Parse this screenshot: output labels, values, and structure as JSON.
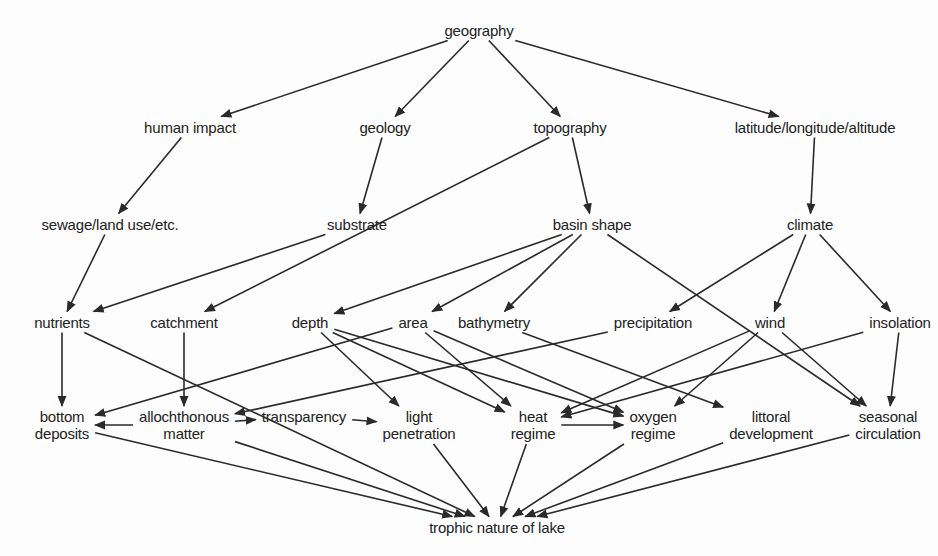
{
  "diagram": {
    "type": "directed-graph",
    "line_color": "#2a2a2a",
    "text_color": "#222222",
    "background": "#fdfdfd",
    "nodes": {
      "geography": {
        "label": "geography",
        "x": 479,
        "y": 30
      },
      "human_impact": {
        "label": "human impact",
        "x": 190,
        "y": 127
      },
      "geology": {
        "label": "geology",
        "x": 385,
        "y": 127
      },
      "topography": {
        "label": "topography",
        "x": 570,
        "y": 127
      },
      "lat_long_alt": {
        "label": "latitude/longitude/altitude",
        "x": 815,
        "y": 127
      },
      "sewage": {
        "label": "sewage/land use/etc.",
        "x": 110,
        "y": 224
      },
      "substrate": {
        "label": "substrate",
        "x": 357,
        "y": 224
      },
      "basin_shape": {
        "label": "basin shape",
        "x": 592,
        "y": 224
      },
      "climate": {
        "label": "climate",
        "x": 810,
        "y": 224
      },
      "nutrients": {
        "label": "nutrients",
        "x": 62,
        "y": 322
      },
      "catchment": {
        "label": "catchment",
        "x": 184,
        "y": 322
      },
      "depth": {
        "label": "depth",
        "x": 310,
        "y": 322
      },
      "area": {
        "label": "area",
        "x": 413,
        "y": 322
      },
      "bathymetry": {
        "label": "bathymetry",
        "x": 494,
        "y": 322
      },
      "precipitation": {
        "label": "precipitation",
        "x": 653,
        "y": 322
      },
      "wind": {
        "label": "wind",
        "x": 770,
        "y": 322
      },
      "insolation": {
        "label": "insolation",
        "x": 900,
        "y": 322
      },
      "bottom_deposits": {
        "label": "bottom\ndeposits",
        "x": 62,
        "y": 425
      },
      "allochthonous_matter": {
        "label": "allochthonous\nmatter",
        "x": 184,
        "y": 425
      },
      "transparency": {
        "label": "transparency",
        "x": 304,
        "y": 416
      },
      "light_penetration": {
        "label": "light\npenetration",
        "x": 419,
        "y": 425
      },
      "heat_regime": {
        "label": "heat\nregime",
        "x": 533,
        "y": 425
      },
      "oxygen_regime": {
        "label": "oxygen\nregime",
        "x": 653,
        "y": 425
      },
      "littoral_development": {
        "label": "littoral\ndevelopment",
        "x": 771,
        "y": 425
      },
      "seasonal_circulation": {
        "label": "seasonal\ncirculation",
        "x": 888,
        "y": 425
      },
      "trophic_nature": {
        "label": "trophic nature of lake",
        "x": 497,
        "y": 527
      }
    },
    "edges": [
      {
        "from": "geography",
        "to": "human_impact"
      },
      {
        "from": "geography",
        "to": "geology"
      },
      {
        "from": "geography",
        "to": "topography"
      },
      {
        "from": "geography",
        "to": "lat_long_alt"
      },
      {
        "from": "human_impact",
        "to": "sewage"
      },
      {
        "from": "geology",
        "to": "substrate"
      },
      {
        "from": "topography",
        "to": "catchment"
      },
      {
        "from": "topography",
        "to": "basin_shape"
      },
      {
        "from": "lat_long_alt",
        "to": "climate"
      },
      {
        "from": "sewage",
        "to": "nutrients"
      },
      {
        "from": "substrate",
        "to": "nutrients"
      },
      {
        "from": "basin_shape",
        "to": "depth"
      },
      {
        "from": "basin_shape",
        "to": "area"
      },
      {
        "from": "basin_shape",
        "to": "bathymetry"
      },
      {
        "from": "basin_shape",
        "to": "seasonal_circulation"
      },
      {
        "from": "climate",
        "to": "precipitation"
      },
      {
        "from": "climate",
        "to": "wind"
      },
      {
        "from": "climate",
        "to": "insolation"
      },
      {
        "from": "nutrients",
        "to": "trophic_nature"
      },
      {
        "from": "nutrients",
        "to": "bottom_deposits",
        "note": "line from nutrients region down to bottom deposits"
      },
      {
        "from": "catchment",
        "to": "allochthonous_matter"
      },
      {
        "from": "area",
        "to": "bottom_deposits"
      },
      {
        "from": "precipitation",
        "to": "allochthonous_matter"
      },
      {
        "from": "depth",
        "to": "light_penetration"
      },
      {
        "from": "depth",
        "to": "heat_regime"
      },
      {
        "from": "depth",
        "to": "oxygen_regime"
      },
      {
        "from": "area",
        "to": "heat_regime"
      },
      {
        "from": "area",
        "to": "oxygen_regime"
      },
      {
        "from": "bathymetry",
        "to": "littoral_development"
      },
      {
        "from": "wind",
        "to": "heat_regime"
      },
      {
        "from": "wind",
        "to": "oxygen_regime"
      },
      {
        "from": "wind",
        "to": "seasonal_circulation"
      },
      {
        "from": "insolation",
        "to": "heat_regime"
      },
      {
        "from": "insolation",
        "to": "seasonal_circulation"
      },
      {
        "from": "allochthonous_matter",
        "to": "bottom_deposits"
      },
      {
        "from": "allochthonous_matter",
        "to": "transparency"
      },
      {
        "from": "transparency",
        "to": "light_penetration"
      },
      {
        "from": "heat_regime",
        "to": "oxygen_regime"
      },
      {
        "from": "bottom_deposits",
        "to": "trophic_nature"
      },
      {
        "from": "allochthonous_matter",
        "to": "trophic_nature"
      },
      {
        "from": "light_penetration",
        "to": "trophic_nature"
      },
      {
        "from": "heat_regime",
        "to": "trophic_nature"
      },
      {
        "from": "oxygen_regime",
        "to": "trophic_nature"
      },
      {
        "from": "littoral_development",
        "to": "trophic_nature"
      },
      {
        "from": "seasonal_circulation",
        "to": "trophic_nature"
      }
    ]
  }
}
